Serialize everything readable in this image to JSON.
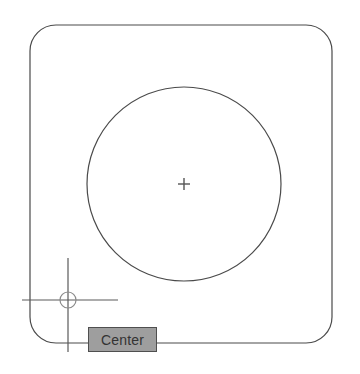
{
  "application": {
    "context": "cad-drawing-viewport",
    "background_color": "#ffffff"
  },
  "viewport": {
    "width": 360,
    "height": 374
  },
  "shapes": {
    "rounded_rectangle": {
      "name": "rounded-rectangle-outline",
      "x": 30,
      "y": 25,
      "width": 302,
      "height": 318,
      "corner_radius": 26,
      "stroke_color": "#4a4a4a",
      "stroke_width": 1.2,
      "fill": "none"
    },
    "circle": {
      "name": "main-circle",
      "center_x": 184,
      "center_y": 184,
      "radius": 97,
      "stroke_color": "#4a4a4a",
      "stroke_width": 1.2,
      "fill": "none"
    },
    "center_mark": {
      "name": "circle-center-mark",
      "center_x": 184,
      "center_y": 184,
      "arm_length": 6,
      "stroke_color": "#555555",
      "stroke_width": 1.4
    }
  },
  "cursor": {
    "name": "crosshair-cursor",
    "center_x": 68,
    "center_y": 300,
    "horizontal_start_x": 22,
    "horizontal_end_x": 118,
    "vertical_start_y": 258,
    "vertical_end_y": 352,
    "stroke_color": "#5a5a5a",
    "stroke_width": 1.2,
    "snap_marker": {
      "name": "center-osnap-marker",
      "shape": "circle",
      "radius": 8,
      "stroke_color": "#8a8a8a",
      "stroke_width": 1.2,
      "fill": "none"
    }
  },
  "tooltip": {
    "name": "osnap-tooltip",
    "label": "Center",
    "x": 88,
    "y": 327,
    "width": 69,
    "height": 25,
    "background_color": "#9e9e9e",
    "border_color": "#4f4f4f",
    "text_color": "#333333",
    "font_size": 14
  }
}
